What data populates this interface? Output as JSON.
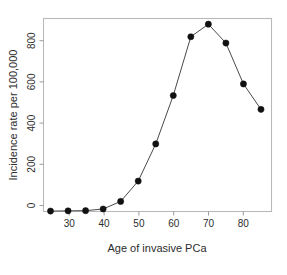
{
  "chart_data": {
    "type": "line",
    "title": "",
    "xlabel": "Age of invasive PCa",
    "ylabel": "Incidence rate per 100,000",
    "x": [
      27,
      32,
      37,
      42,
      47,
      52,
      57,
      62,
      67,
      72,
      77,
      82,
      87
    ],
    "values": [
      2,
      3,
      4,
      12,
      48,
      145,
      322,
      553,
      833,
      893,
      803,
      608,
      487
    ],
    "series": [
      {
        "name": "Incidence rate",
        "values": [
          2,
          3,
          4,
          12,
          48,
          145,
          322,
          553,
          833,
          893,
          803,
          608,
          487
        ]
      }
    ],
    "xlim": [
      25,
      90
    ],
    "ylim": [
      0,
      920
    ],
    "xticks": [
      30,
      40,
      50,
      60,
      70,
      80
    ],
    "xtick_labels": [
      "30",
      "40",
      "50",
      "60",
      "70",
      "80"
    ],
    "yticks": [
      0,
      200,
      400,
      600,
      800
    ],
    "ytick_labels": [
      "0",
      "200",
      "400",
      "600",
      "800"
    ],
    "grid": false,
    "legend": false,
    "legend_position": "none",
    "marker": "filled-circle",
    "line_color": "#4a4a4a",
    "marker_color": "#111111"
  },
  "figure": {
    "background_color": "#ffffff",
    "frame_color": "#b9b9b9"
  }
}
